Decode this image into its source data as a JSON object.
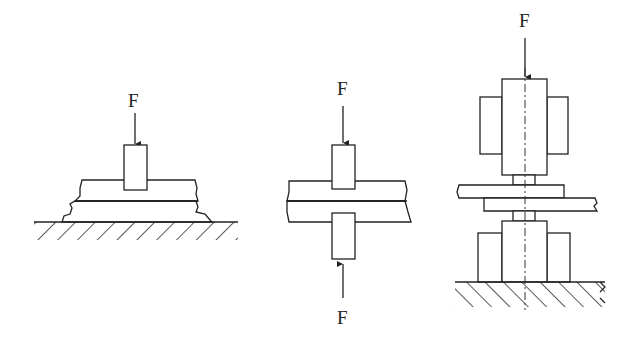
{
  "diagram": {
    "type": "technical mechanical drawing",
    "figures": [
      {
        "id": "single-sided",
        "force_labels": [
          "F"
        ],
        "parts": [
          "punch",
          "upper plate",
          "lower plate",
          "base (hatched)"
        ]
      },
      {
        "id": "double-sided",
        "force_labels": [
          "F",
          "F"
        ],
        "parts": [
          "upper punch",
          "upper plate",
          "lower plate",
          "lower punch"
        ]
      },
      {
        "id": "electrode-press",
        "force_labels": [
          "F"
        ],
        "parts": [
          "upper electrode",
          "upper holders (hatched)",
          "upper plate",
          "lower plate",
          "lower electrode",
          "lower holders (hatched)",
          "base (hatched)",
          "centerline"
        ]
      }
    ]
  },
  "labels": {
    "f1_top": "F",
    "f2_top": "F",
    "f2_bottom": "F",
    "f3_top": "F"
  }
}
